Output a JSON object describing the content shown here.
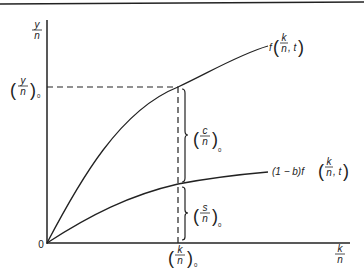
{
  "diagram": {
    "type": "growth-model",
    "axes": {
      "y_label_num": "y",
      "y_label_den": "n",
      "x_label_num": "k",
      "x_label_den": "n",
      "origin": "0"
    },
    "curves": [
      {
        "name": "production",
        "label_prefix": "f",
        "label_num": "k",
        "label_den": "n",
        "label_suffix": ", t"
      },
      {
        "name": "saving",
        "label_prefix": "(1 − b)f",
        "label_num": "k",
        "label_den": "n",
        "label_suffix": ", t"
      }
    ],
    "markers": {
      "y0_num": "y",
      "y0_den": "n",
      "y0_sub": "0",
      "k0_num": "k",
      "k0_den": "n",
      "k0_sub": "0",
      "c0_num": "c",
      "c0_den": "n",
      "c0_sub": "0",
      "s0_num": "s",
      "s0_den": "n",
      "s0_sub": "0"
    },
    "colors": {
      "ink": "#222222",
      "background": "#ffffff"
    }
  }
}
